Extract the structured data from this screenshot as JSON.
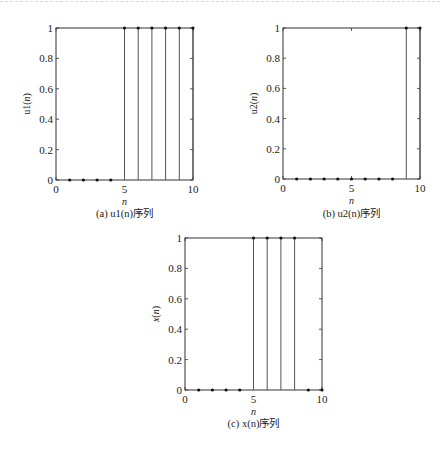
{
  "chart_data": [
    {
      "type": "stem",
      "id": "a",
      "caption_tag": "(a)",
      "caption_text": "u1(n)序列",
      "ylabel": "u1(n)",
      "xlabel": "n",
      "xlim": [
        0,
        10
      ],
      "ylim": [
        0,
        1
      ],
      "xticks": [
        0,
        5,
        10
      ],
      "yticks": [
        0,
        0.2,
        0.4,
        0.6,
        0.8,
        1
      ],
      "x": [
        1,
        2,
        3,
        4,
        5,
        6,
        7,
        8,
        9,
        10
      ],
      "values": [
        0,
        0,
        0,
        0,
        1,
        1,
        1,
        1,
        1,
        1
      ],
      "grid": false
    },
    {
      "type": "stem",
      "id": "b",
      "caption_tag": "(b)",
      "caption_text": "u2(n)序列",
      "ylabel": "u2(n)",
      "xlabel": "n",
      "xlim": [
        0,
        10
      ],
      "ylim": [
        0,
        1
      ],
      "xticks": [
        0,
        5,
        10
      ],
      "yticks": [
        0,
        0.2,
        0.4,
        0.6,
        0.8,
        1
      ],
      "x": [
        1,
        2,
        3,
        4,
        5,
        6,
        7,
        8,
        9,
        10
      ],
      "values": [
        0,
        0,
        0,
        0,
        0,
        0,
        0,
        0,
        1,
        1
      ],
      "grid": false
    },
    {
      "type": "stem",
      "id": "c",
      "caption_tag": "(c)",
      "caption_text": "x(n)序列",
      "ylabel": "x(n)",
      "xlabel": "n",
      "xlim": [
        0,
        10
      ],
      "ylim": [
        0,
        1
      ],
      "xticks": [
        0,
        5,
        10
      ],
      "yticks": [
        0,
        0.2,
        0.4,
        0.6,
        0.8,
        1
      ],
      "x": [
        1,
        2,
        3,
        4,
        5,
        6,
        7,
        8,
        9,
        10
      ],
      "values": [
        0,
        0,
        0,
        0,
        1,
        1,
        1,
        1,
        0,
        0
      ],
      "grid": false
    }
  ],
  "captions": {
    "a": "(a)  u1(n)序列",
    "b": "(b)  u2(n)序列",
    "c": "(c)  x(n)序列"
  },
  "colors": {
    "axis": "#333333",
    "stem": "#555555",
    "marker": "#111111"
  }
}
